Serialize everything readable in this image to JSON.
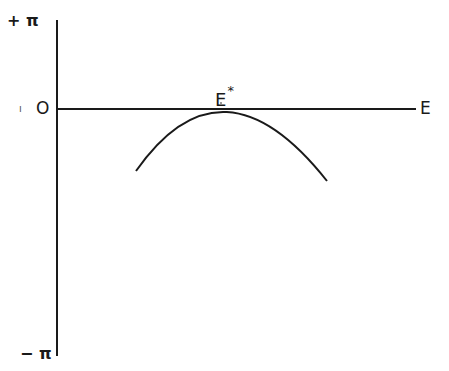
{
  "diagram": {
    "y_axis": {
      "top_label": "+ π",
      "zero_label": "O",
      "bottom_label": "− π"
    },
    "x_axis": {
      "label": "E"
    },
    "curve": {
      "type": "inverted-parabola",
      "peak_label": "E",
      "peak_label_superscript": "*"
    },
    "colors": {
      "line": "#1a1a1a",
      "background": "#ffffff"
    }
  }
}
